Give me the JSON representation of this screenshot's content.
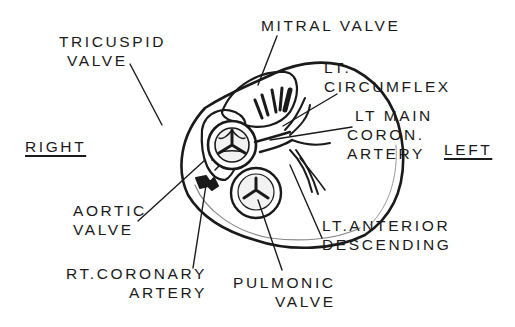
{
  "diagram": {
    "type": "anatomical-illustration",
    "colors": {
      "ink": "#1a1a1a",
      "background": "#ffffff",
      "shade": "#d9d9d9"
    },
    "orientation": {
      "right": "RIGHT",
      "left": "LEFT"
    },
    "labels": {
      "tricuspid": {
        "line1": "TRICUSPID",
        "line2": "VALVE"
      },
      "mitral": {
        "line1": "MITRAL VALVE"
      },
      "circumflex": {
        "line1": "LT.",
        "line2": "CIRCUMFLEX"
      },
      "lt_main": {
        "line1": "LT MAIN",
        "line2": "CORON.",
        "line3": "ARTERY"
      },
      "aortic": {
        "line1": "AORTIC",
        "line2": "VALVE"
      },
      "rt_coronary": {
        "line1": "RT.CORONARY",
        "line2": "ARTERY"
      },
      "pulmonic": {
        "line1": "PULMONIC",
        "line2": "VALVE"
      },
      "lad": {
        "line1": "LT.ANTERIOR",
        "line2": "DESCENDING"
      }
    }
  }
}
